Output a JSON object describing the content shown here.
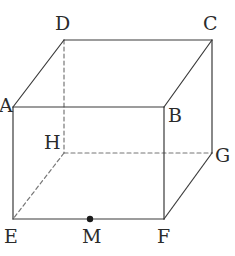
{
  "figure": {
    "name": "rectangular-prism-cube",
    "canvas": {
      "width": 235,
      "height": 256,
      "background": "#ffffff"
    },
    "style": {
      "solid_edge_color": "#3a3a3a",
      "hidden_edge_color": "#777777",
      "edge_width": 1.2,
      "hidden_dash": "4,3",
      "point_color": "#1a1a1a",
      "point_radius": 3.2,
      "label_color": "#2b2b2b"
    },
    "vertices": [
      {
        "id": "A",
        "label": "A",
        "x": 13,
        "y": 107,
        "label_x": -1,
        "label_y": 96,
        "hidden": false
      },
      {
        "id": "B",
        "label": "B",
        "x": 164,
        "y": 107,
        "label_x": 168,
        "label_y": 106,
        "hidden": false
      },
      {
        "id": "C",
        "label": "C",
        "x": 212,
        "y": 40,
        "label_x": 203,
        "label_y": 14,
        "hidden": false
      },
      {
        "id": "D",
        "label": "D",
        "x": 64,
        "y": 40,
        "label_x": 55,
        "label_y": 14,
        "hidden": false
      },
      {
        "id": "E",
        "label": "E",
        "x": 13,
        "y": 219,
        "label_x": 4,
        "label_y": 227,
        "hidden": false
      },
      {
        "id": "F",
        "label": "F",
        "x": 164,
        "y": 219,
        "label_x": 157,
        "label_y": 227,
        "hidden": false
      },
      {
        "id": "G",
        "label": "G",
        "x": 212,
        "y": 153,
        "label_x": 215,
        "label_y": 146,
        "hidden": false
      },
      {
        "id": "H",
        "label": "H",
        "x": 64,
        "y": 153,
        "label_x": 44,
        "label_y": 133,
        "hidden": true
      }
    ],
    "points": [
      {
        "id": "M",
        "label": "M",
        "x": 90,
        "y": 219,
        "label_x": 82,
        "label_y": 227,
        "on_edge": "EF",
        "marker": "filled-dot"
      }
    ],
    "edges": [
      {
        "id": "AB",
        "from": "A",
        "to": "B",
        "hidden": false
      },
      {
        "id": "BC",
        "from": "B",
        "to": "C",
        "hidden": false
      },
      {
        "id": "CD",
        "from": "C",
        "to": "D",
        "hidden": false
      },
      {
        "id": "DA",
        "from": "D",
        "to": "A",
        "hidden": false
      },
      {
        "id": "EF",
        "from": "E",
        "to": "F",
        "hidden": false
      },
      {
        "id": "FG",
        "from": "F",
        "to": "G",
        "hidden": false
      },
      {
        "id": "GC",
        "from": "G",
        "to": "C",
        "hidden": false
      },
      {
        "id": "AE",
        "from": "A",
        "to": "E",
        "hidden": false
      },
      {
        "id": "BF",
        "from": "B",
        "to": "F",
        "hidden": false
      },
      {
        "id": "DH",
        "from": "D",
        "to": "H",
        "hidden": true
      },
      {
        "id": "HG",
        "from": "H",
        "to": "G",
        "hidden": true
      },
      {
        "id": "HE",
        "from": "H",
        "to": "E",
        "hidden": true
      }
    ]
  }
}
